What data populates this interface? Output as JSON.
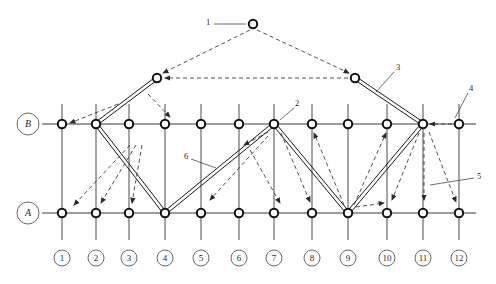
{
  "diagram": {
    "colors": {
      "node_stroke": "#111111",
      "node_fill": "#ffffff",
      "grid": "#4a4a4a",
      "member": "#1a1a1a",
      "dashed": "#3d3d3d",
      "label_text": "#2a2a2a"
    },
    "row_labels": [
      {
        "id": "row-b",
        "text": "B",
        "cx": 28,
        "cy": 124,
        "r": 11
      },
      {
        "id": "row-a",
        "text": "A",
        "cx": 28,
        "cy": 213,
        "r": 11
      }
    ],
    "column_labels": [
      {
        "text": "1",
        "cx": 62,
        "cy": 258,
        "r": 8
      },
      {
        "text": "2",
        "cx": 96,
        "cy": 258,
        "r": 8
      },
      {
        "text": "3",
        "cx": 129,
        "cy": 258,
        "r": 8
      },
      {
        "text": "4",
        "cx": 165,
        "cy": 258,
        "r": 8
      },
      {
        "text": "5",
        "cx": 201,
        "cy": 258,
        "r": 8
      },
      {
        "text": "6",
        "cx": 239,
        "cy": 258,
        "r": 8
      },
      {
        "text": "7",
        "cx": 274,
        "cy": 258,
        "r": 8
      },
      {
        "text": "8",
        "cx": 312,
        "cy": 258,
        "r": 8
      },
      {
        "text": "9",
        "cx": 348,
        "cy": 258,
        "r": 8
      },
      {
        "text": "10",
        "cx": 387,
        "cy": 258,
        "r": 8
      },
      {
        "text": "11",
        "cx": 423,
        "cy": 258,
        "r": 8
      },
      {
        "text": "12",
        "cx": 459,
        "cy": 258,
        "r": 8
      }
    ],
    "callouts": [
      {
        "text": "1",
        "x": 208,
        "y": 23,
        "leader": "M 214 24 L 246 24"
      },
      {
        "text": "2",
        "x": 297,
        "y": 104,
        "leader": "M 294 108 L 280 120"
      },
      {
        "text": "3",
        "x": 398,
        "y": 68,
        "leader": "M 394 72 L 376 92"
      },
      {
        "text": "4",
        "x": 471,
        "y": 89,
        "leader": "M 468 93 L 455 118"
      },
      {
        "text": "5",
        "x": 479,
        "y": 177,
        "leader": "M 474 178 L 430 185"
      },
      {
        "text": "6",
        "x": 186,
        "y": 157,
        "leader": "M 191 159 L 216 168"
      }
    ],
    "grid_columns": [
      62,
      96,
      129,
      165,
      201,
      239,
      274,
      312,
      348,
      387,
      423,
      459
    ],
    "rows": {
      "top_chord_y": 124,
      "bottom_chord_y": 213,
      "grid_top_y": 104,
      "grid_bottom_y": 240
    },
    "chord_extent": {
      "x_start": 42,
      "x_end": 476
    },
    "upper_nodes": [
      {
        "id": "apex",
        "cx": 253,
        "cy": 24
      },
      {
        "id": "upper-left",
        "cx": 157,
        "cy": 78
      },
      {
        "id": "upper-right",
        "cx": 355,
        "cy": 78
      }
    ],
    "top_chord_nodes": [
      62,
      96,
      129,
      165,
      201,
      239,
      274,
      312,
      348,
      387,
      423,
      459
    ],
    "bottom_chord_nodes": [
      62,
      96,
      129,
      165,
      201,
      239,
      274,
      312,
      348,
      387,
      423,
      459
    ],
    "truss_members": [
      {
        "id": "member-left-raker",
        "x1": 96,
        "y1": 124,
        "x2": 157,
        "y2": 78
      },
      {
        "id": "member-right-raker",
        "x1": 355,
        "y1": 78,
        "x2": 423,
        "y2": 124
      },
      {
        "id": "member-zig-1",
        "x1": 96,
        "y1": 124,
        "x2": 165,
        "y2": 213
      },
      {
        "id": "member-zig-2",
        "x1": 165,
        "y1": 213,
        "x2": 274,
        "y2": 124
      },
      {
        "id": "member-zig-3",
        "x1": 274,
        "y1": 124,
        "x2": 348,
        "y2": 213
      },
      {
        "id": "member-zig-4",
        "x1": 348,
        "y1": 213,
        "x2": 423,
        "y2": 124
      }
    ],
    "flow_arrows": [
      {
        "id": "arrow-apex-to-upper-left",
        "x1": 250,
        "y1": 30,
        "x2": 163,
        "y2": 73
      },
      {
        "id": "arrow-apex-to-upper-right",
        "x1": 257,
        "y1": 30,
        "x2": 349,
        "y2": 73
      },
      {
        "id": "arrow-upper-right-to-left",
        "x1": 348,
        "y1": 78,
        "x2": 165,
        "y2": 78
      },
      {
        "id": "arrow-upperleft-to-nodeB1",
        "x1": 118,
        "y1": 104,
        "x2": 70,
        "y2": 123
      },
      {
        "id": "arrow-upperleft-to-nodeB4",
        "x1": 148,
        "y1": 94,
        "x2": 170,
        "y2": 117
      },
      {
        "id": "arrow-mid-to-a2",
        "x1": 130,
        "y1": 145,
        "x2": 74,
        "y2": 205
      },
      {
        "id": "arrow-mid-to-a3",
        "x1": 136,
        "y1": 145,
        "x2": 101,
        "y2": 203
      },
      {
        "id": "arrow-mid-to-a4",
        "x1": 142,
        "y1": 145,
        "x2": 132,
        "y2": 203
      },
      {
        "id": "arrow-6-to-a7",
        "x1": 250,
        "y1": 150,
        "x2": 280,
        "y2": 203
      },
      {
        "id": "arrow-n7-to-b6",
        "x1": 268,
        "y1": 132,
        "x2": 244,
        "y2": 145
      },
      {
        "id": "arrow-n7-to-a6",
        "x1": 268,
        "y1": 136,
        "x2": 210,
        "y2": 200
      },
      {
        "id": "arrow-n7-to-a8",
        "x1": 281,
        "y1": 133,
        "x2": 310,
        "y2": 202
      },
      {
        "id": "arrow-a9-to-b8",
        "x1": 344,
        "y1": 205,
        "x2": 314,
        "y2": 133
      },
      {
        "id": "arrow-a9-to-b10",
        "x1": 354,
        "y1": 205,
        "x2": 386,
        "y2": 133
      },
      {
        "id": "arrow-a9-to-a10",
        "x1": 356,
        "y1": 207,
        "x2": 384,
        "y2": 203
      },
      {
        "id": "arrow-b11-to-a10",
        "x1": 419,
        "y1": 133,
        "x2": 392,
        "y2": 200
      },
      {
        "id": "arrow-b11-to-a11",
        "x1": 424,
        "y1": 133,
        "x2": 424,
        "y2": 200
      },
      {
        "id": "arrow-b11-to-a12",
        "x1": 429,
        "y1": 132,
        "x2": 456,
        "y2": 202
      },
      {
        "id": "arrow-b12-to-b11",
        "x1": 452,
        "y1": 124,
        "x2": 430,
        "y2": 124
      }
    ]
  }
}
